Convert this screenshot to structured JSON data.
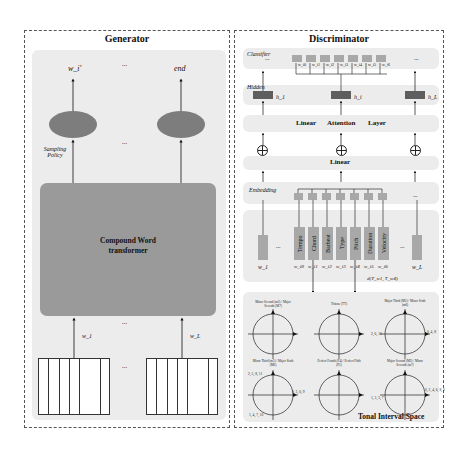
{
  "generator": {
    "title": "Generator",
    "outputs": [
      "w_i'",
      "end"
    ],
    "ellipsis": "...",
    "sampling_label": "Sampling Policy",
    "transformer_label": "Compound Word transformer",
    "inputs": [
      "w_1",
      "w_L"
    ],
    "input_ellipsis": "...",
    "colors": {
      "panel_bg": "#ececec",
      "ellipse": "#7d7d7d",
      "transformer": "#9a9a9a"
    }
  },
  "discriminator": {
    "title": "Discriminator",
    "classifier_label": "Classifier",
    "classifier_weights": [
      "w_i0",
      "w_i1",
      "w_i2",
      "w_i3",
      "w_i4",
      "w_i5",
      "w_i6"
    ],
    "hidden_label": "Hidden",
    "hidden_units": [
      "h_1",
      "h_i",
      "h_L"
    ],
    "attention_layer": [
      "Linear",
      "Attention",
      "Layer"
    ],
    "linear_label": "Linear",
    "embedding_label": "Embedding",
    "tokens": [
      "Tempo",
      "Chord",
      "Barbeat",
      "Type",
      "Pitch",
      "Duration",
      "Velocity"
    ],
    "token_subs": [
      "w_i0",
      "w_i1",
      "w_i2",
      "w_i3",
      "w_i4",
      "w_i5",
      "w_i6"
    ],
    "side_tokens": [
      "w_1",
      "w_L"
    ],
    "distance_label": "d(T_w1, T_w4)",
    "ellipsis": "..."
  },
  "tonal_space": {
    "title": "Tonal Interval Space",
    "circles": [
      {
        "top": "Minor Second (m2) / Major Seventh (M7)",
        "bottom": "",
        "points": [
          "1",
          "2",
          "3",
          "4",
          "5",
          "6",
          "7",
          "8",
          "9",
          "10",
          "11",
          "0"
        ]
      },
      {
        "top": "Tritone (TT)",
        "bottom": "Perfect Fourth (P4) / Perfect Fifth (P5)",
        "points": [
          "6, 10",
          "0, 4",
          "2, 11",
          "3, 7",
          "1, 5",
          "8"
        ]
      },
      {
        "top": "Major Third (M3) / Minor Sixth (m6)",
        "bottom": "Major Second (M2) / Minor Seventh (m7)",
        "points": [
          "2, 6, 10",
          "0, 4, 8",
          "3, 7, 11",
          "1, 5, 9"
        ]
      },
      {
        "top": "Minor Third (m3) / Major Sixth (M6)",
        "bottom": "",
        "points": [
          "2, 5, 8, 11",
          "0, 3, 6, 9",
          "1, 4, 7, 10"
        ]
      },
      {
        "top": "Perfect Fourth (P4) / Perfect Fifth (P5)",
        "bottom": "",
        "points": [
          "11",
          "0",
          "1",
          "2",
          "3",
          "4",
          "5",
          "6",
          "7",
          "8",
          "9",
          "10"
        ]
      },
      {
        "top": "Major Second (M2) / Minor Seventh (m7)",
        "bottom": "",
        "points": [
          "1, 3, 5, 7",
          "0, 2, 4, 6, 8, 10",
          "1, 3, 5, 7, 9, 11"
        ]
      }
    ]
  }
}
